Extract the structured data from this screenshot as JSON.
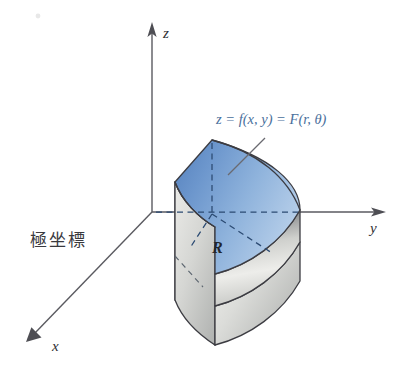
{
  "figure": {
    "title_note": "Polar coordinates solid region diagram",
    "axes": {
      "z_label": "z",
      "y_label": "y",
      "x_label": "x"
    },
    "labels": {
      "region": "R",
      "caption_cjk": "極坐標",
      "formula": "z = f(x, y) = F(r, θ)"
    },
    "colors": {
      "surface_blue_dark": "#5f8ec6",
      "surface_blue_light": "#b9d0ea",
      "wall_gray_light": "#f2f2f0",
      "wall_gray_dark": "#8d8f8e",
      "outline": "#3c3c42",
      "axis": "#5a5a60",
      "formula_text": "#4a6f9c",
      "dash_blue": "#2b4a72"
    }
  }
}
